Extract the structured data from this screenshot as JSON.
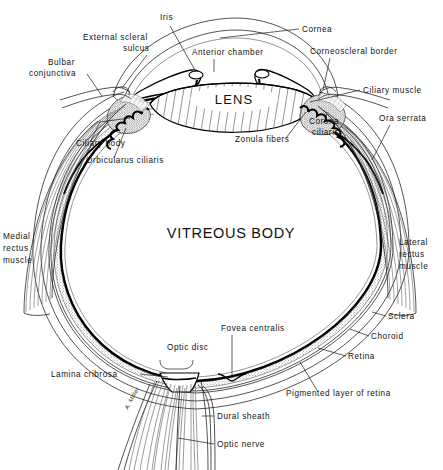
{
  "figure": {
    "background_color": "#ffffff",
    "ink_color": "#111111"
  },
  "regions": {
    "lens": "LENS",
    "vitreous_body": "VITREOUS BODY"
  },
  "labels": [
    {
      "id": "iris",
      "text": "Iris",
      "x": 160,
      "y": 20,
      "anchor": "start"
    },
    {
      "id": "cornea",
      "text": "Cornea",
      "x": 302,
      "y": 32,
      "anchor": "start"
    },
    {
      "id": "external-scleral-sulcus-1",
      "text": "External scleral",
      "x": 83,
      "y": 40,
      "anchor": "start"
    },
    {
      "id": "external-scleral-sulcus-2",
      "text": "sulcus",
      "x": 123,
      "y": 51,
      "anchor": "start"
    },
    {
      "id": "anterior-chamber",
      "text": "Anterior chamber",
      "x": 192,
      "y": 55,
      "anchor": "start"
    },
    {
      "id": "corneoscleral-border",
      "text": "Corneoscleral border",
      "x": 310,
      "y": 54,
      "anchor": "start"
    },
    {
      "id": "bulbar-conjunctiva-1",
      "text": "Bulbar",
      "x": 48,
      "y": 65,
      "anchor": "start"
    },
    {
      "id": "bulbar-conjunctiva-2",
      "text": "conjunctiva",
      "x": 29,
      "y": 76,
      "anchor": "start"
    },
    {
      "id": "ciliary-muscle",
      "text": "Ciliary muscle",
      "x": 363,
      "y": 93,
      "anchor": "start"
    },
    {
      "id": "ora-serrata",
      "text": "Ora serrata",
      "x": 379,
      "y": 121,
      "anchor": "start"
    },
    {
      "id": "corona-ciliaris-1",
      "text": "Corona",
      "x": 309,
      "y": 124,
      "anchor": "start"
    },
    {
      "id": "corona-ciliaris-2",
      "text": "ciliaris",
      "x": 312,
      "y": 135,
      "anchor": "start"
    },
    {
      "id": "zonula-fibers",
      "text": "Zonula fibers",
      "x": 235,
      "y": 142,
      "anchor": "start"
    },
    {
      "id": "ciliary-body",
      "text": "Ciliary body",
      "x": 76,
      "y": 146,
      "anchor": "start"
    },
    {
      "id": "orbicularus-ciliaris",
      "text": "Orbicularus ciliaris",
      "x": 86,
      "y": 163,
      "anchor": "start"
    },
    {
      "id": "medial-rectus-1",
      "text": "Medial",
      "x": 3,
      "y": 239,
      "anchor": "start"
    },
    {
      "id": "medial-rectus-2",
      "text": "rectus",
      "x": 3,
      "y": 251,
      "anchor": "start"
    },
    {
      "id": "medial-rectus-3",
      "text": "muscle",
      "x": 3,
      "y": 263,
      "anchor": "start"
    },
    {
      "id": "lateral-rectus-1",
      "text": "Lateral",
      "x": 399,
      "y": 245,
      "anchor": "start"
    },
    {
      "id": "lateral-rectus-2",
      "text": "rectus",
      "x": 399,
      "y": 257,
      "anchor": "start"
    },
    {
      "id": "lateral-rectus-3",
      "text": "muscle",
      "x": 399,
      "y": 269,
      "anchor": "start"
    },
    {
      "id": "sclera",
      "text": "Sclera",
      "x": 388,
      "y": 319,
      "anchor": "start"
    },
    {
      "id": "fovea-centralis",
      "text": "Fovea centralis",
      "x": 221,
      "y": 331,
      "anchor": "start"
    },
    {
      "id": "choroid",
      "text": "Choroid",
      "x": 371,
      "y": 339,
      "anchor": "start"
    },
    {
      "id": "optic-disc",
      "text": "Optic disc",
      "x": 167,
      "y": 350,
      "anchor": "start"
    },
    {
      "id": "retina",
      "text": "Retina",
      "x": 348,
      "y": 359,
      "anchor": "start"
    },
    {
      "id": "lamina-cribrosa",
      "text": "Lamina cribrosa",
      "x": 51,
      "y": 377,
      "anchor": "start"
    },
    {
      "id": "pigmented-layer-of-retina",
      "text": "Pigmented layer of retina",
      "x": 286,
      "y": 396,
      "anchor": "start"
    },
    {
      "id": "dural-sheath",
      "text": "Dural sheath",
      "x": 217,
      "y": 419,
      "anchor": "start"
    },
    {
      "id": "optic-nerve",
      "text": "Optic nerve",
      "x": 217,
      "y": 447,
      "anchor": "start"
    }
  ],
  "signature": {
    "text": "A. Miller",
    "x": 128,
    "y": 410
  }
}
